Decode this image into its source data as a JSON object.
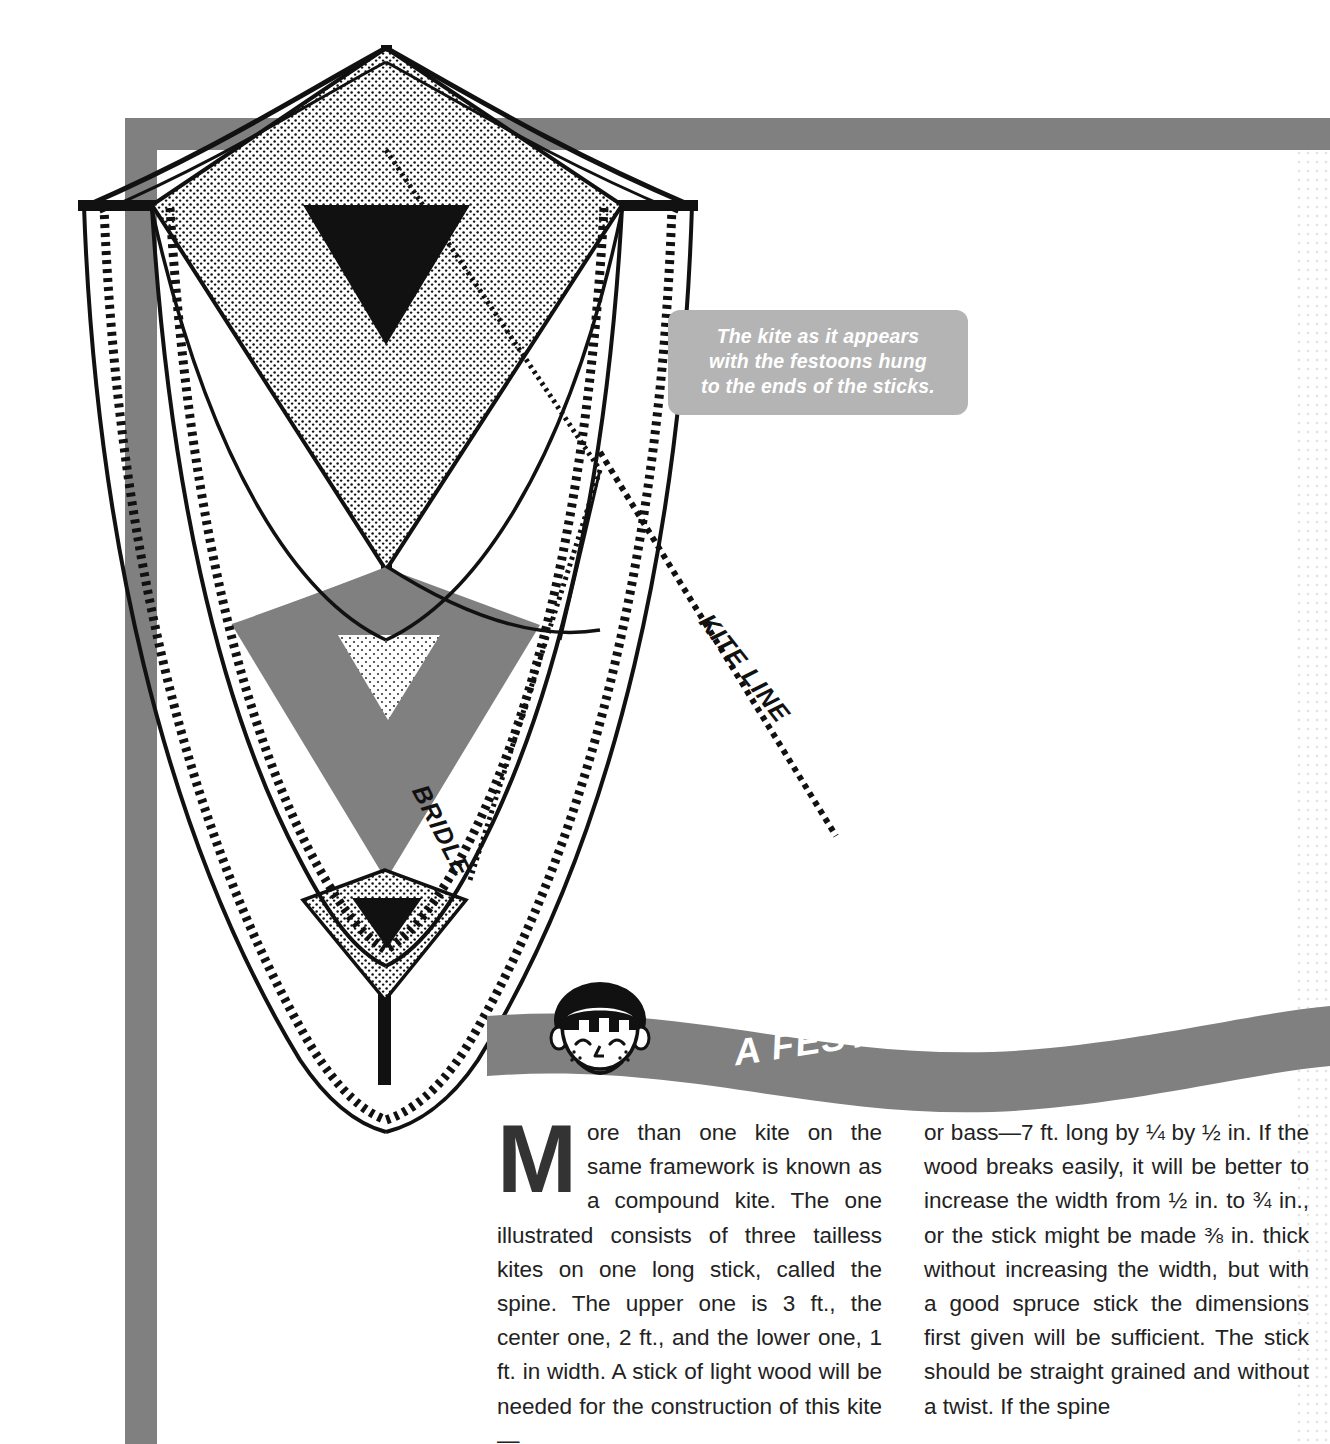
{
  "page": {
    "width": 1330,
    "height": 1444,
    "background": "#ffffff"
  },
  "colors": {
    "frame_gray": "#808080",
    "caption_gray": "#b4b4b4",
    "banner_gray": "#808080",
    "ink": "#111111",
    "text": "#222222"
  },
  "caption": {
    "line1": "The kite as it appears",
    "line2": "with the festoons hung",
    "line3": "to the ends of the sticks.",
    "text": "The kite as it appears with the festoons hung to the ends of the sticks."
  },
  "banner": {
    "title": "A FESTOONED KITE",
    "mascot": "boy-face"
  },
  "diagram": {
    "labels": [
      {
        "name": "kite-line",
        "text": "KITE LINE"
      },
      {
        "name": "bridle",
        "text": "BRIDLE"
      }
    ],
    "kites": [
      {
        "name": "upper-kite",
        "fill": "stipple",
        "emblem": "black-triangle"
      },
      {
        "name": "center-kite",
        "fill": "solid-gray",
        "emblem": "stipple-triangle"
      },
      {
        "name": "lower-kite",
        "fill": "stipple",
        "emblem": "black-triangle"
      }
    ]
  },
  "article": {
    "dropcap": "M",
    "left_column": "ore than one kite on the same framework is known as a compound kite. The one illustrated consists of three tailless kites on one long stick, called the spine. The upper one is 3 ft., the center one, 2 ft., and the lower one, 1 ft. in width. A stick of light wood will be needed for the construction of this kite—",
    "right_column": "or bass—7 ft. long by ¼ by ½ in. If the wood breaks easily, it will be better to increase the width from ½ in. to ¾ in., or the stick might be made ⅜ in. thick without increasing the width, but with a good spruce stick the dimensions first given will be sufficient. The stick should be straight grained and without a twist. If the spine"
  }
}
